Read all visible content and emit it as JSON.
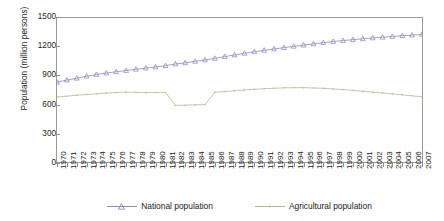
{
  "chart_data": {
    "type": "line",
    "title": "",
    "xlabel": "",
    "ylabel": "Population (million persons)",
    "ylim": [
      0,
      1500
    ],
    "yticks": [
      0,
      300,
      600,
      900,
      1200,
      1500
    ],
    "ytick_labels": [
      "0",
      "300",
      "600",
      "900",
      "1200",
      "1500"
    ],
    "grid": false,
    "legend_position": "bottom",
    "x": [
      "1970",
      "1971",
      "1972",
      "1973",
      "1974",
      "1975",
      "1976",
      "1977",
      "1978",
      "1979",
      "1980",
      "1981",
      "1982",
      "1983",
      "1984",
      "1985",
      "1986",
      "1987",
      "1988",
      "1989",
      "1990",
      "1991",
      "1992",
      "1993",
      "1994",
      "1995",
      "1996",
      "1997",
      "1998",
      "1999",
      "2000",
      "2001",
      "2002",
      "2003",
      "2004",
      "2005",
      "2006",
      "2007"
    ],
    "series": [
      {
        "name": "National population",
        "color": "#8a8ac0",
        "marker": "triangle",
        "values": [
          830,
          852,
          871,
          892,
          909,
          924,
          937,
          950,
          963,
          975,
          987,
          1000,
          1017,
          1030,
          1044,
          1059,
          1075,
          1093,
          1110,
          1127,
          1143,
          1158,
          1172,
          1185,
          1199,
          1211,
          1224,
          1236,
          1248,
          1258,
          1267,
          1276,
          1285,
          1292,
          1300,
          1308,
          1314,
          1321
        ]
      },
      {
        "name": "Agricultural population",
        "color": "#b9b98a",
        "marker": "dot",
        "values": [
          678,
          687,
          696,
          704,
          711,
          718,
          724,
          728,
          726,
          723,
          724,
          725,
          592,
          594,
          597,
          600,
          727,
          734,
          742,
          750,
          757,
          763,
          768,
          772,
          774,
          774,
          771,
          767,
          761,
          754,
          746,
          737,
          728,
          719,
          710,
          700,
          690,
          680
        ]
      }
    ]
  },
  "legend": {
    "items": [
      {
        "label": "National population"
      },
      {
        "label": "Agricultural population"
      }
    ]
  }
}
